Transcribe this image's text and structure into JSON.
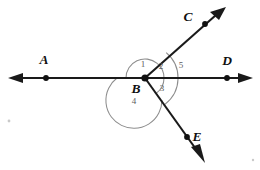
{
  "figure": {
    "background_color": "#ffffff",
    "line_color": "#1a1a1a",
    "arc_color": "#8d8d8d",
    "label_color": "#101010",
    "number_color": "#5d5d5d"
  },
  "points": {
    "A": {
      "label": "A",
      "x": 46,
      "y": 78,
      "label_x": 44,
      "label_y": 64
    },
    "B": {
      "label": "B",
      "x": 145,
      "y": 78,
      "label_x": 136,
      "label_y": 93
    },
    "C": {
      "label": "C",
      "x": 205,
      "y": 24,
      "label_x": 188,
      "label_y": 21
    },
    "D": {
      "label": "D",
      "x": 227,
      "y": 78,
      "label_x": 227,
      "label_y": 65
    },
    "E": {
      "label": "E",
      "x": 187,
      "y": 137,
      "label_x": 196,
      "label_y": 140
    }
  },
  "angles": [
    {
      "id": "1",
      "label": "1",
      "label_x": 143,
      "label_y": 67,
      "from": "BA",
      "to": "BC",
      "radius": 19
    },
    {
      "id": "2",
      "label": "2",
      "label_x": 161,
      "label_y": 69,
      "from": "BC",
      "to": "BD",
      "radius": 19
    },
    {
      "id": "3",
      "label": "3",
      "label_x": 162,
      "label_y": 91,
      "from": "BD",
      "to": "BE",
      "radius": 19
    },
    {
      "id": "4",
      "label": "4",
      "label_x": 134,
      "label_y": 104,
      "from": "BE",
      "to": "BA",
      "radius": 28
    },
    {
      "id": "5",
      "label": "5",
      "label_x": 181,
      "label_y": 68,
      "from": "BC",
      "to": "BE",
      "radius": 33
    }
  ],
  "rays": [
    {
      "name": "ray-BA",
      "from": "B",
      "through": "A",
      "arrow": true
    },
    {
      "name": "ray-BD",
      "from": "B",
      "through": "D",
      "arrow": true
    },
    {
      "name": "ray-BC",
      "from": "B",
      "through": "C",
      "arrow": true
    },
    {
      "name": "ray-BE",
      "from": "B",
      "through": "E",
      "arrow": true
    }
  ]
}
